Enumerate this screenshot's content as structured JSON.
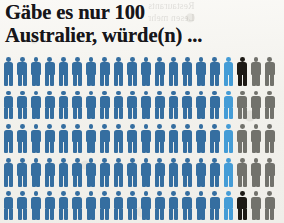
{
  "headline": {
    "line1": "Gäbe es nur 100",
    "line2": "Australier, würde(n) ..."
  },
  "background_bleed": {
    "line1": "Restaurants",
    "line2": "Lesen mehr"
  },
  "colors": {
    "primary_blue": "#2f6a9e",
    "light_blue": "#3f9ad6",
    "black": "#17140f",
    "gray": "#6e6e68",
    "paper": "#f2f1ec",
    "headline_text": "#17161a"
  },
  "chart_data": {
    "type": "pictogram",
    "title": "Gäbe es nur 100 Australier, würde(n) ...",
    "unit_label": "1 Figur = 1 Australier",
    "total_units": 100,
    "columns": 20,
    "rows": 5,
    "xlabel": "",
    "ylabel": "",
    "legend_position": "none",
    "grid": false,
    "categories": [
      "dunkelblau",
      "hellblau",
      "schwarz",
      "grau"
    ],
    "values": [
      85,
      5,
      2,
      8
    ],
    "series": [
      {
        "name": "dunkelblau",
        "color": "#2f6a9e",
        "count": 85
      },
      {
        "name": "hellblau",
        "color": "#3f9ad6",
        "count": 5
      },
      {
        "name": "schwarz",
        "color": "#17140f",
        "count": 2
      },
      {
        "name": "grau",
        "color": "#6e6e68",
        "count": 8
      }
    ],
    "rows_detail": [
      {
        "row": 1,
        "cells": [
          "blue",
          "blue",
          "blue",
          "blue",
          "blue",
          "blue",
          "blue",
          "blue",
          "blue",
          "blue",
          "blue",
          "blue",
          "blue",
          "blue",
          "blue",
          "blue",
          "light",
          "black",
          "gray",
          "gray"
        ]
      },
      {
        "row": 2,
        "cells": [
          "blue",
          "blue",
          "blue",
          "blue",
          "blue",
          "blue",
          "blue",
          "blue",
          "blue",
          "blue",
          "blue",
          "blue",
          "blue",
          "blue",
          "blue",
          "blue",
          "light",
          "gray",
          "gray",
          "gray"
        ]
      },
      {
        "row": 3,
        "cells": [
          "blue",
          "blue",
          "blue",
          "blue",
          "blue",
          "blue",
          "blue",
          "blue",
          "blue",
          "blue",
          "blue",
          "blue",
          "blue",
          "blue",
          "blue",
          "blue",
          "light",
          "gray",
          "gray",
          "gray"
        ]
      },
      {
        "row": 4,
        "cells": [
          "blue",
          "blue",
          "blue",
          "blue",
          "blue",
          "blue",
          "blue",
          "blue",
          "blue",
          "blue",
          "blue",
          "blue",
          "blue",
          "blue",
          "blue",
          "blue",
          "light",
          "gray",
          "gray",
          "gray"
        ]
      },
      {
        "row": 5,
        "cells": [
          "blue",
          "blue",
          "blue",
          "blue",
          "blue",
          "blue",
          "blue",
          "blue",
          "blue",
          "blue",
          "blue",
          "blue",
          "blue",
          "blue",
          "blue",
          "blue",
          "light",
          "black",
          "gray",
          "gray"
        ]
      }
    ]
  }
}
